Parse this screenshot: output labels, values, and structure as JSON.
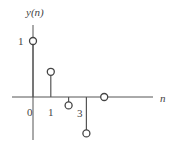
{
  "chart_data": {
    "type": "stem",
    "title": "",
    "ylabel": "y(n)",
    "xlabel": "n",
    "x": [
      0,
      1,
      2,
      3,
      4
    ],
    "values": [
      1.0,
      0.45,
      -0.15,
      -0.65,
      0.0
    ],
    "x_tick_labels": [
      "0",
      "1",
      "3"
    ],
    "y_tick_labels": [
      "1"
    ],
    "marker": "open-circle",
    "grid": false,
    "legend": null
  },
  "labels": {
    "ylabel": "y(n)",
    "xlabel": "n",
    "ytick_1": "1",
    "xtick_0": "0",
    "xtick_1": "1",
    "xtick_3": "3"
  }
}
